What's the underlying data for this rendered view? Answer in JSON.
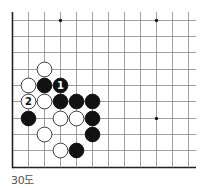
{
  "diagram": {
    "caption": "30도",
    "grid": {
      "x_lines": [
        12.5,
        28.5,
        44.5,
        60.5,
        76.5,
        92.5,
        108.5,
        124.5,
        140.5,
        156.5,
        172.5,
        188.5
      ],
      "y_lines": [
        20.5,
        36.5,
        52.5,
        69.5,
        85.5,
        101.5,
        118.5,
        134.5,
        150.5,
        167.5
      ],
      "x_extent": [
        12.5,
        196
      ],
      "y_extent": [
        12,
        167.5
      ],
      "line_color": "#888888",
      "edge_color": "#222222"
    },
    "star_points": [
      [
        3,
        0
      ],
      [
        9,
        0
      ],
      [
        9,
        6
      ]
    ],
    "stones": [
      {
        "col": 2,
        "row": 3,
        "color": "white",
        "label": ""
      },
      {
        "col": 1,
        "row": 4,
        "color": "white",
        "label": ""
      },
      {
        "col": 2,
        "row": 4,
        "color": "black",
        "label": ""
      },
      {
        "col": 3,
        "row": 4,
        "color": "black",
        "label": "1"
      },
      {
        "col": 1,
        "row": 5,
        "color": "white",
        "label": "2"
      },
      {
        "col": 2,
        "row": 5,
        "color": "white",
        "label": ""
      },
      {
        "col": 3,
        "row": 5,
        "color": "black",
        "label": ""
      },
      {
        "col": 4,
        "row": 5,
        "color": "black",
        "label": ""
      },
      {
        "col": 5,
        "row": 5,
        "color": "black",
        "label": ""
      },
      {
        "col": 1,
        "row": 6,
        "color": "black",
        "label": ""
      },
      {
        "col": 3,
        "row": 6,
        "color": "white",
        "label": ""
      },
      {
        "col": 4,
        "row": 6,
        "color": "white",
        "label": ""
      },
      {
        "col": 5,
        "row": 6,
        "color": "black",
        "label": ""
      },
      {
        "col": 2,
        "row": 7,
        "color": "white",
        "label": ""
      },
      {
        "col": 5,
        "row": 7,
        "color": "black",
        "label": ""
      },
      {
        "col": 3,
        "row": 8,
        "color": "white",
        "label": ""
      },
      {
        "col": 4,
        "row": 8,
        "color": "black",
        "label": ""
      }
    ]
  }
}
